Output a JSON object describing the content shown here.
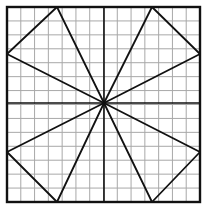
{
  "figure": {
    "canvas": {
      "width": 209,
      "height": 214
    },
    "square": {
      "x1": 7,
      "y1": 7,
      "x2": 200,
      "y2": 202
    },
    "center": {
      "x": 104,
      "y": 103
    },
    "grid": {
      "cells": 14,
      "color": "#a8a8a8",
      "stroke_width": 1
    },
    "colors": {
      "line": "#111111",
      "grid": "#a8a8a8",
      "background": "#ffffff"
    },
    "edge_points": [
      {
        "name": "top-left-apex",
        "x": 57,
        "y": 7
      },
      {
        "name": "top-right-apex",
        "x": 152,
        "y": 7
      },
      {
        "name": "right-upper",
        "x": 200,
        "y": 54
      },
      {
        "name": "right-lower",
        "x": 200,
        "y": 152
      },
      {
        "name": "bottom-right-apex",
        "x": 152,
        "y": 202
      },
      {
        "name": "bottom-left-apex",
        "x": 57,
        "y": 202
      },
      {
        "name": "left-lower",
        "x": 7,
        "y": 152
      },
      {
        "name": "left-upper",
        "x": 7,
        "y": 54
      }
    ],
    "chords": [
      {
        "name": "top-left-chord",
        "from": 0,
        "to": 7
      },
      {
        "name": "top-right-chord",
        "from": 1,
        "to": 2
      },
      {
        "name": "bottom-right-chord",
        "from": 3,
        "to": 4
      },
      {
        "name": "bottom-left-chord",
        "from": 5,
        "to": 6
      }
    ]
  }
}
